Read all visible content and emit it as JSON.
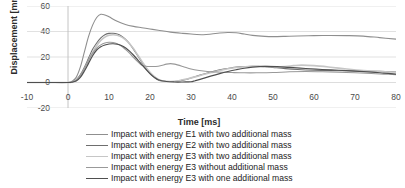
{
  "chart_data": {
    "type": "line",
    "title": "",
    "xlabel": "Time [ms]",
    "ylabel": "Displacement [mm]",
    "xlim": [
      -10,
      80
    ],
    "ylim": [
      -20,
      60
    ],
    "xticks": [
      -10,
      0,
      10,
      20,
      30,
      40,
      50,
      60,
      70,
      80
    ],
    "yticks": [
      -20,
      0,
      20,
      40,
      60
    ],
    "grid": "horizontal",
    "legend_position": "bottom",
    "series": [
      {
        "name": "Impact with energy E1 with two additional mass",
        "color": "#8f8f8f",
        "width": 1.1,
        "x": [
          -10,
          -5,
          0,
          1,
          2,
          3,
          4,
          5,
          6,
          7,
          8,
          9,
          10,
          12,
          14,
          16,
          18,
          20,
          22,
          25,
          28,
          30,
          33,
          35,
          37,
          39,
          41,
          43,
          45,
          48,
          50,
          53,
          56,
          60,
          64,
          68,
          72,
          76,
          80
        ],
        "y": [
          0,
          0,
          0,
          1,
          4,
          12,
          24,
          36,
          45,
          51,
          53.5,
          53,
          51.5,
          48,
          45.5,
          44,
          43,
          42,
          41,
          39.5,
          38.5,
          38,
          37.5,
          38,
          38.8,
          39.2,
          39,
          38,
          37,
          36.2,
          36,
          36.2,
          36.5,
          36.8,
          36.9,
          36.8,
          36.4,
          35.2,
          34
        ]
      },
      {
        "name": "Impact with energy E2 with two additional mass",
        "color": "#6e6e6e",
        "width": 1.1,
        "x": [
          -10,
          -5,
          0,
          1,
          2,
          3,
          4,
          5,
          6,
          7,
          8,
          9,
          10,
          11,
          12,
          13,
          14,
          15,
          16,
          17,
          18,
          19,
          20,
          21,
          22,
          23,
          25,
          27,
          29,
          30,
          32,
          34,
          36,
          38,
          40,
          42,
          45,
          48,
          50,
          53,
          56,
          60,
          64,
          68,
          72,
          76,
          80
        ],
        "y": [
          0,
          0,
          0,
          0.5,
          2,
          6,
          12,
          19,
          26,
          31,
          35,
          37.5,
          38.5,
          38.6,
          38,
          36.5,
          34,
          30.5,
          26,
          21,
          16,
          11,
          7,
          4,
          2,
          1.2,
          0.8,
          1.2,
          2.6,
          3.6,
          5.6,
          7.5,
          9.2,
          10.6,
          11.6,
          12.3,
          12.8,
          12.4,
          11.8,
          10.9,
          10.2,
          9.6,
          9.3,
          9.2,
          9.0,
          8.7,
          8.4
        ]
      },
      {
        "name": "Impact with energy E3 with two additional mass",
        "color": "#c6c6c6",
        "width": 1.6,
        "x": [
          -10,
          -5,
          0,
          1,
          2,
          3,
          4,
          5,
          6,
          7,
          8,
          9,
          10,
          11,
          12,
          13,
          14,
          15,
          16,
          17,
          18,
          19,
          20,
          21,
          22,
          23,
          25,
          27,
          29,
          31,
          33,
          35,
          37,
          39,
          41,
          44,
          47,
          50,
          53,
          55,
          57,
          60,
          64,
          68,
          72,
          76,
          80
        ],
        "y": [
          0,
          0,
          0,
          0.4,
          1.6,
          5,
          10.5,
          17,
          23.5,
          29,
          33,
          35.6,
          37,
          37.4,
          37,
          35.8,
          33.6,
          30.4,
          26.4,
          21.6,
          16.8,
          12,
          8,
          4.8,
          2.6,
          1.4,
          0.8,
          1.4,
          2.8,
          4.4,
          6.2,
          7.8,
          9.4,
          10.8,
          11.8,
          12.6,
          12.8,
          12.4,
          12.6,
          13.2,
          13.6,
          13.2,
          12,
          10.6,
          9.4,
          8.6,
          8.2
        ]
      },
      {
        "name": "Impact with energy E3 without additional mass",
        "color": "#999999",
        "width": 1.1,
        "x": [
          -10,
          -5,
          0,
          1,
          2,
          3,
          4,
          5,
          6,
          7,
          8,
          9,
          10,
          11,
          12,
          13,
          14,
          15,
          16,
          17,
          18,
          19,
          20,
          22,
          24,
          25,
          26,
          28,
          30,
          32,
          34,
          36,
          38,
          40,
          43,
          46,
          50,
          54,
          58,
          62,
          66,
          70,
          74,
          77,
          80
        ],
        "y": [
          0,
          0,
          0,
          0.4,
          1.8,
          5.5,
          11,
          17.5,
          23,
          27,
          29.5,
          31,
          31.6,
          31.4,
          30.4,
          28.6,
          26,
          23,
          19.6,
          16.4,
          13.6,
          12.8,
          12.6,
          12.8,
          14.4,
          14.8,
          14.4,
          12.6,
          10.6,
          9.4,
          8.6,
          8.2,
          8.0,
          7.8,
          7.6,
          7.6,
          7.8,
          8.4,
          8.6,
          8.4,
          8.0,
          7.6,
          7.0,
          6.6,
          6.2
        ]
      },
      {
        "name": "Impact with energy E3 with one additional mass",
        "color": "#4f4f4f",
        "width": 1.2,
        "x": [
          -10,
          -5,
          0,
          1,
          2,
          3,
          4,
          5,
          6,
          7,
          8,
          9,
          10,
          11,
          12,
          13,
          14,
          15,
          16,
          17,
          18,
          19,
          20,
          21,
          22,
          24,
          26,
          28,
          29,
          30,
          31,
          33,
          35,
          37,
          39,
          41,
          43,
          45,
          48,
          51,
          54,
          58,
          62,
          66,
          70,
          74,
          77,
          80
        ],
        "y": [
          0,
          0,
          0,
          0.3,
          1.2,
          4,
          9,
          15,
          21,
          25.5,
          28,
          29.4,
          30.2,
          30.4,
          30,
          29,
          27.2,
          24.6,
          21.4,
          17.8,
          14,
          10.4,
          7,
          4.2,
          2.2,
          0.8,
          0.4,
          0.4,
          0.5,
          0.6,
          1.4,
          3.2,
          5.2,
          7.0,
          8.6,
          10.0,
          11.2,
          12.0,
          12.6,
          12.4,
          11.8,
          11.0,
          10.2,
          9.6,
          9.0,
          8.2,
          7.4,
          6.6
        ]
      }
    ]
  },
  "axes": {
    "y_title": "Displacement [mm]",
    "x_title": "Time [ms]",
    "y_tick_labels": [
      "60",
      "40",
      "20",
      "0",
      "-20"
    ],
    "x_tick_labels": [
      "-10",
      "0",
      "10",
      "20",
      "30",
      "40",
      "50",
      "60",
      "70",
      "80"
    ]
  },
  "legend": {
    "items": [
      {
        "label": "Impact with energy E1 with two additional mass",
        "color": "#8f8f8f"
      },
      {
        "label": "Impact with energy E2 with two additional mass",
        "color": "#6e6e6e"
      },
      {
        "label": "Impact with energy E3 with two additional mass",
        "color": "#c6c6c6"
      },
      {
        "label": "Impact with energy E3 without additional mass",
        "color": "#999999"
      },
      {
        "label": "Impact with energy E3 with one additional mass",
        "color": "#4f4f4f"
      }
    ]
  }
}
